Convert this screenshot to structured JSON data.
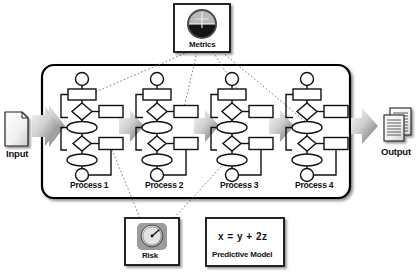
{
  "diagram": {
    "background_color": "#ffffff",
    "line_color": "#111111",
    "arrow_gradient": [
      "#f2f2f2",
      "#6e6e6e"
    ],
    "connector_style": "dotted"
  },
  "input": {
    "label": "Input",
    "icon": "document-icon"
  },
  "output": {
    "label": "Output",
    "icon": "document-stack-icon"
  },
  "container": {
    "name": "process-container",
    "border_color": "#000000",
    "shadow": true
  },
  "processes": [
    {
      "id": "process-1",
      "label": "Process 1"
    },
    {
      "id": "process-2",
      "label": "Process 2"
    },
    {
      "id": "process-3",
      "label": "Process 3"
    },
    {
      "id": "process-4",
      "label": "Process 4"
    }
  ],
  "flow_arrows": [
    {
      "name": "arrow-input-to-process-1"
    },
    {
      "name": "arrow-process-1-to-2"
    },
    {
      "name": "arrow-process-2-to-3"
    },
    {
      "name": "arrow-process-3-to-4"
    },
    {
      "name": "arrow-process-4-to-output"
    }
  ],
  "annotations": {
    "metrics": {
      "label": "Metrics",
      "icon": "gauge-horizon-icon",
      "position": "top"
    },
    "risk": {
      "label": "Risk",
      "icon": "dial-meter-icon",
      "position": "bottom"
    },
    "predictive_model": {
      "formula": "x  =  y  +  2z",
      "label": "Predictive Model",
      "position": "bottom"
    }
  },
  "flowchart_nodes": [
    "start-circle",
    "task-rect",
    "decision-diamond-upper",
    "side-rect-upper",
    "ellipse-upper",
    "decision-diamond-lower",
    "side-rect-lower",
    "ellipse-lower",
    "end-circle"
  ]
}
